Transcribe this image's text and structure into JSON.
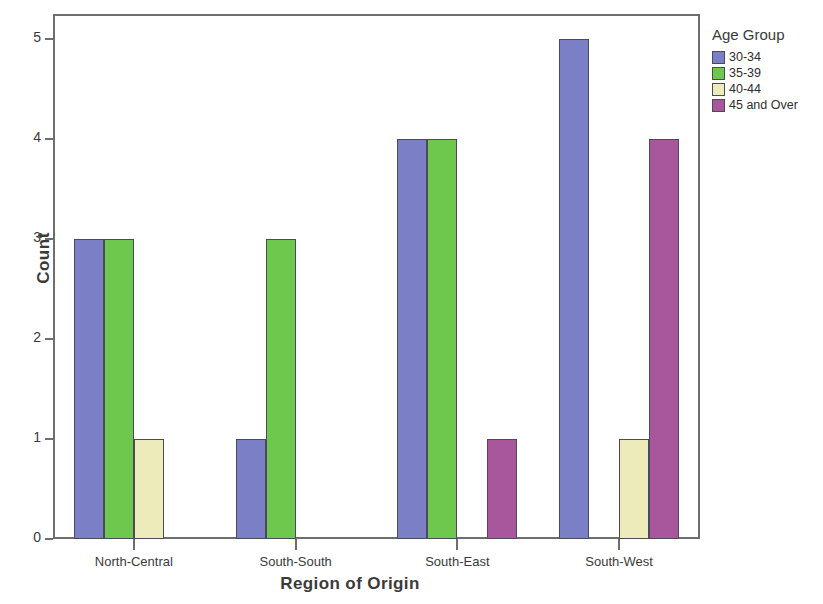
{
  "chart_data": {
    "type": "bar",
    "title": "",
    "xlabel": "Region of Origin",
    "ylabel": "Count",
    "categories": [
      "North-Central",
      "South-South",
      "South-East",
      "South-West"
    ],
    "series": [
      {
        "name": "30-34",
        "color": "#7b80c6",
        "values": [
          3,
          1,
          4,
          5
        ]
      },
      {
        "name": "35-39",
        "color": "#6ec84e",
        "values": [
          3,
          3,
          4,
          0
        ]
      },
      {
        "name": "40-44",
        "color": "#ecebb9",
        "values": [
          1,
          0,
          0,
          1
        ]
      },
      {
        "name": "45 and Over",
        "color": "#a8579c",
        "values": [
          0,
          0,
          1,
          4
        ]
      }
    ],
    "ylim": [
      0,
      5
    ],
    "yticks": [
      0,
      1,
      2,
      3,
      4,
      5
    ],
    "ytick_labels": [
      "0",
      "1",
      "2",
      "3",
      "4",
      "5"
    ],
    "grid": false,
    "legend": {
      "title": "Age Group",
      "position": "right"
    }
  },
  "legend": {
    "title": "Age Group",
    "entries": [
      "30-34",
      "35-39",
      "40-44",
      "45 and Over"
    ]
  },
  "axes": {
    "x_label": "Region of Origin",
    "y_label": "Count"
  }
}
